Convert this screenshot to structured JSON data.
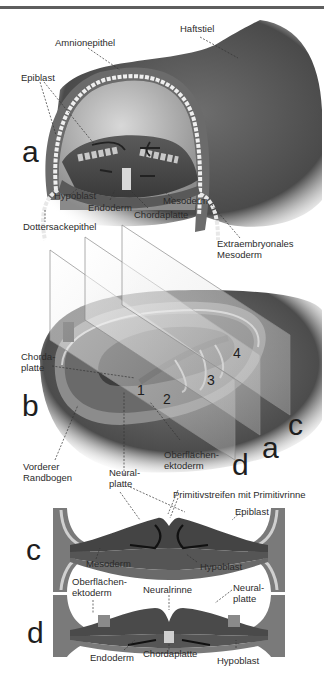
{
  "figure": {
    "colors": {
      "ink": "#2b2b2b",
      "tissue_dark": "#3c3c3c",
      "tissue_mid": "#6a6a6a",
      "tissue_light": "#9a9a9a",
      "highlight": "#d0d0d0",
      "rule": "#5e5e5e"
    },
    "panels": {
      "a": {
        "letter": "a",
        "labels": {
          "haftstiel": "Haftstiel",
          "amnionepithel": "Amnionepithel",
          "epiblast": "Epiblast",
          "hypoblast": "Hypoblast",
          "endoderm": "Endoderm",
          "chordaplatte": "Chordaplatte",
          "mesoderm": "Mesoderm",
          "dottersackepithel": "Dottersackepithel",
          "extraembryonales_mesoderm": "Extraembryonales\nMesoderm"
        }
      },
      "b": {
        "letter": "b",
        "labels": {
          "chordaplatte": "Chorda-\nplatte",
          "vorderer_randbogen": "Vorderer\nRandbogen",
          "oberflaechenektoderm": "Oberflächen-\nektoderm",
          "neuralplatte": "Neural-\nplatte"
        },
        "numbers": [
          "1",
          "2",
          "3",
          "4"
        ],
        "section_planes": [
          "a",
          "c",
          "d"
        ]
      },
      "c": {
        "letter": "c",
        "labels": {
          "primitivstreifen": "Primitivstreifen mit Primitivrinne",
          "epiblast": "Epiblast",
          "mesoderm": "Mesoderm",
          "hypoblast": "Hypoblast"
        }
      },
      "d": {
        "letter": "d",
        "labels": {
          "oberflaechenektoderm": "Oberflächen-\nektoderm",
          "neuralrinne": "Neuralrinne",
          "neuralplatte": "Neural-\nplatte",
          "endoderm": "Endoderm",
          "chordaplatte": "Chordaplatte",
          "hypoblast": "Hypoblast"
        }
      }
    }
  }
}
